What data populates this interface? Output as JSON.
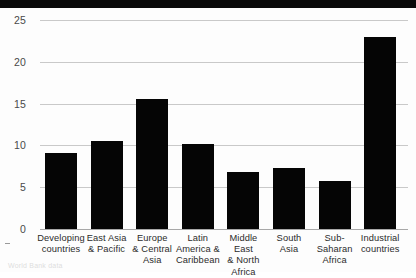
{
  "chart_data": {
    "type": "bar",
    "title": "",
    "xlabel": "",
    "ylabel": "",
    "ylim": [
      0,
      25
    ],
    "yticks": [
      0,
      5,
      10,
      15,
      20,
      25
    ],
    "grid": true,
    "legend": false,
    "categories": [
      "Developing countries",
      "East Asia & Pacific",
      "Europe & Central Asia",
      "Latin America & Caribbean",
      "Middle East & North Africa",
      "South Asia",
      "Sub-Saharan Africa",
      "Industrial countries"
    ],
    "category_lines": [
      [
        "Developing",
        "countries"
      ],
      [
        "East Asia",
        "& Pacific"
      ],
      [
        "Europe",
        "& Central",
        "Asia"
      ],
      [
        "Latin",
        "America &",
        "Caribbean"
      ],
      [
        "Middle East",
        "& North",
        "Africa"
      ],
      [
        "South",
        "Asia"
      ],
      [
        "Sub-Saharan",
        "Africa"
      ],
      [
        "Industrial",
        "countries"
      ]
    ],
    "values": [
      9.1,
      10.5,
      15.6,
      10.2,
      6.8,
      7.3,
      5.8,
      23.0
    ],
    "bar_color": "#050505",
    "grid_color": "#c9c9c9"
  },
  "caption": {
    "text": "World Bank data"
  }
}
